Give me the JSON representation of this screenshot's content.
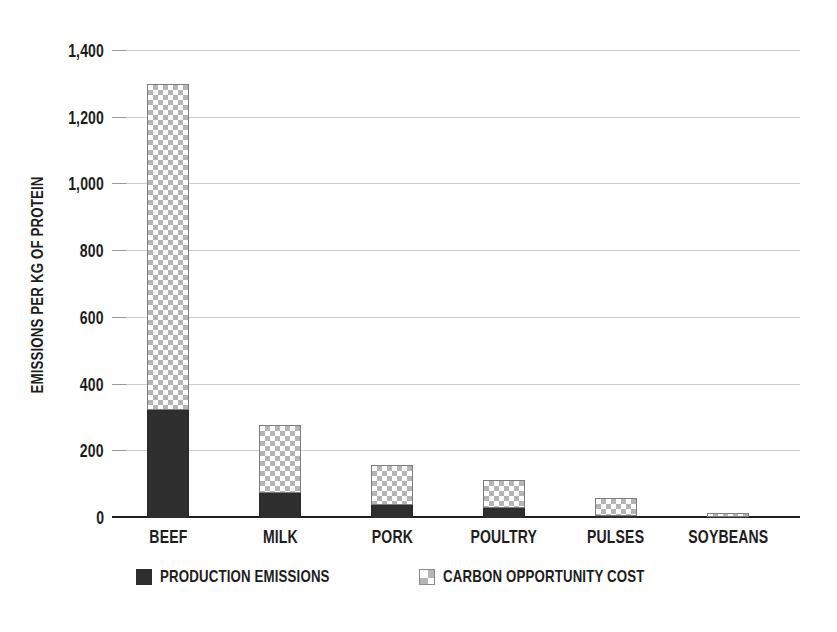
{
  "page": {
    "background": "#ffffff"
  },
  "chart_data": {
    "type": "bar",
    "stacked": true,
    "orientation": "vertical",
    "title": "",
    "xlabel": "",
    "ylabel": "EMISSIONS PER KG OF PROTEIN",
    "categories": [
      "BEEF",
      "MILK",
      "PORK",
      "POULTRY",
      "PULSES",
      "SOYBEANS"
    ],
    "series": [
      {
        "name": "PRODUCTION EMISSIONS",
        "style": "solid",
        "color": "#2e2e2e",
        "values": [
          325,
          75,
          40,
          30,
          5,
          2
        ]
      },
      {
        "name": "CARBON OPPORTUNITY COST",
        "style": "checkerboard",
        "color": "#b5b5b5",
        "values": [
          975,
          205,
          120,
          85,
          55,
          13
        ]
      }
    ],
    "stack_totals": [
      1300,
      280,
      160,
      115,
      60,
      15
    ],
    "ylim": [
      0,
      1400
    ],
    "yticks": [
      {
        "value": 0,
        "label": "0"
      },
      {
        "value": 200,
        "label": "200"
      },
      {
        "value": 400,
        "label": "400"
      },
      {
        "value": 600,
        "label": "600"
      },
      {
        "value": 800,
        "label": "800"
      },
      {
        "value": 1000,
        "label": "1,000"
      },
      {
        "value": 1200,
        "label": "1,200"
      },
      {
        "value": 1400,
        "label": "1,400"
      }
    ],
    "grid": "horizontal",
    "legend_position": "bottom-center"
  },
  "colors": {
    "bar_solid": "#2e2e2e",
    "checker_gray": "#b5b5b5",
    "checker_bg": "#ffffff",
    "bar_border": "#7d7d7d",
    "gridline": "#cccccc",
    "axis_line": "#1f1f1f",
    "text": "#1d1d1d"
  }
}
